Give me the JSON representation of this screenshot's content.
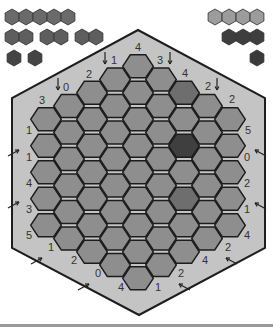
{
  "game": {
    "title": "Hexagonal puzzle board",
    "colors": {
      "background": "#ffffff",
      "board_frame": "#c4c4c4",
      "board_outline": "#1e1e1e",
      "cell": "#8e8e8e",
      "cell_stroke": "#1c1c1c",
      "cell_medium": "#6e6e6e",
      "cell_dark": "#3f3f3f",
      "label": "#333333"
    },
    "board": {
      "radius": 4,
      "columns_cell_counts": [
        5,
        6,
        7,
        8,
        9,
        8,
        7,
        6,
        5
      ],
      "center_x": 138,
      "top_y": 53,
      "cell_height": 26.5,
      "col_spacing": 23,
      "outline": [
        [
          138,
          30
        ],
        [
          265,
          98
        ],
        [
          265,
          248
        ],
        [
          139,
          315
        ],
        [
          12,
          248
        ],
        [
          12,
          98
        ]
      ],
      "highlighted_cells": [
        {
          "col": 6,
          "row": 0,
          "shade": "medium"
        },
        {
          "col": 6,
          "row": 2,
          "shade": "dark"
        },
        {
          "col": 6,
          "row": 4,
          "shade": "medium"
        }
      ]
    },
    "edge_labels": [
      {
        "text": "3",
        "x": 42,
        "y": 104,
        "arrow": null
      },
      {
        "text": "0",
        "x": 66,
        "y": 91,
        "arrow": "down",
        "ax": 58,
        "ay": 78
      },
      {
        "text": "2",
        "x": 89,
        "y": 78,
        "arrow": null
      },
      {
        "text": "1",
        "x": 114,
        "y": 64,
        "arrow": "down",
        "ax": 105,
        "ay": 52
      },
      {
        "text": "4",
        "x": 138,
        "y": 51,
        "arrow": null
      },
      {
        "text": "3",
        "x": 160,
        "y": 64,
        "arrow": "down",
        "ax": 170,
        "ay": 52
      },
      {
        "text": "4",
        "x": 185,
        "y": 77,
        "arrow": null
      },
      {
        "text": "2",
        "x": 208,
        "y": 90,
        "arrow": "down",
        "ax": 217,
        "ay": 78
      },
      {
        "text": "2",
        "x": 232,
        "y": 103,
        "arrow": null
      },
      {
        "text": "5",
        "x": 248,
        "y": 134,
        "arrow": null
      },
      {
        "text": "0",
        "x": 247,
        "y": 161,
        "arrow": "up-left",
        "ax": 258,
        "ay": 151
      },
      {
        "text": "2",
        "x": 247,
        "y": 187,
        "arrow": null
      },
      {
        "text": "1",
        "x": 247,
        "y": 213,
        "arrow": "up-left",
        "ax": 258,
        "ay": 204
      },
      {
        "text": "4",
        "x": 247,
        "y": 239,
        "arrow": null
      },
      {
        "text": "2",
        "x": 228,
        "y": 251,
        "arrow": "up-left",
        "ax": 229,
        "ay": 259
      },
      {
        "text": "4",
        "x": 205,
        "y": 264,
        "arrow": null
      },
      {
        "text": "2",
        "x": 181,
        "y": 277,
        "arrow": "up-left",
        "ax": 182,
        "ay": 285
      },
      {
        "text": "1",
        "x": 158,
        "y": 291,
        "arrow": null
      },
      {
        "text": "4",
        "x": 121,
        "y": 291,
        "arrow": null
      },
      {
        "text": "0",
        "x": 98,
        "y": 277,
        "arrow": "up-right",
        "ax": 86,
        "ay": 285
      },
      {
        "text": "2",
        "x": 74,
        "y": 264,
        "arrow": null
      },
      {
        "text": "1",
        "x": 51,
        "y": 251,
        "arrow": "up-right",
        "ax": 39,
        "ay": 259
      },
      {
        "text": "5",
        "x": 29,
        "y": 239,
        "arrow": null
      },
      {
        "text": "3",
        "x": 29,
        "y": 213,
        "arrow": "up-right",
        "ax": 16,
        "ay": 203
      },
      {
        "text": "4",
        "x": 29,
        "y": 187,
        "arrow": null
      },
      {
        "text": "1",
        "x": 29,
        "y": 161,
        "arrow": "up-right",
        "ax": 16,
        "ay": 151
      },
      {
        "text": "1",
        "x": 29,
        "y": 134,
        "arrow": null
      }
    ],
    "palette_left": [
      {
        "row": 0,
        "color": "#6a6a6a",
        "groups": [
          [
            12,
            26,
            40,
            54,
            68
          ]
        ]
      },
      {
        "row": 1,
        "color": "#5e5e5e",
        "groups": [
          [
            12,
            26
          ],
          [
            47,
            61
          ],
          [
            82,
            96
          ]
        ]
      },
      {
        "row": 2,
        "color": "#444444",
        "groups": [
          [
            14
          ],
          [
            35
          ]
        ]
      }
    ],
    "palette_right": [
      {
        "row": 0,
        "color": "#9c9c9c",
        "groups": [
          [
            215,
            229,
            243,
            257
          ]
        ]
      },
      {
        "row": 1,
        "color": "#3e3e3e",
        "groups": [
          [
            229,
            243,
            257
          ]
        ]
      },
      {
        "row": 2,
        "color": "#3a3a3a",
        "groups": [
          [
            257
          ]
        ]
      }
    ],
    "palette_row_y": [
      17,
      37,
      58
    ]
  }
}
